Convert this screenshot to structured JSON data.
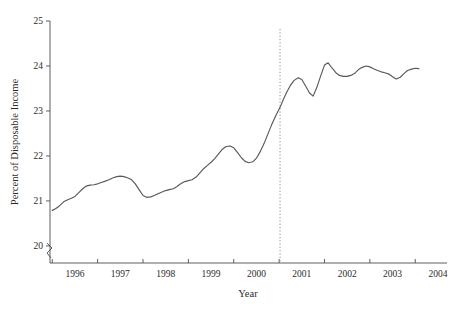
{
  "chart_data": {
    "type": "line",
    "title": "",
    "xlabel": "Year",
    "ylabel": "Percent of Disposable Income",
    "xlim": [
      1995.45,
      2004.2
    ],
    "ylim": [
      19.62,
      25.0
    ],
    "yaxis_break": true,
    "grid": false,
    "legend": false,
    "xticks": [
      1996,
      1997,
      1998,
      1999,
      2000,
      2001,
      2002,
      2003,
      2004
    ],
    "xtick_labels": [
      "1996",
      "1997",
      "1998",
      "1999",
      "2000",
      "2001",
      "2002",
      "2003",
      "2004"
    ],
    "yticks": [
      20,
      21,
      22,
      23,
      24,
      25
    ],
    "ytick_labels": [
      "20",
      "21",
      "22",
      "23",
      "24",
      "25"
    ],
    "line_color": "#595959",
    "annotations": [
      {
        "name": "vertical-reference-line",
        "type": "vline",
        "x": 2000.52,
        "style": "dotted",
        "color": "#8c8c8c"
      }
    ],
    "series": [
      {
        "name": "Percent of Disposable Income",
        "color": "#595959",
        "x": [
          1995.5,
          1995.58,
          1995.67,
          1995.75,
          1995.83,
          1995.92,
          1996.0,
          1996.08,
          1996.17,
          1996.25,
          1996.33,
          1996.42,
          1996.5,
          1996.58,
          1996.67,
          1996.75,
          1996.83,
          1996.92,
          1997.0,
          1997.08,
          1997.17,
          1997.25,
          1997.33,
          1997.42,
          1997.5,
          1997.58,
          1997.67,
          1997.75,
          1997.83,
          1997.92,
          1998.0,
          1998.08,
          1998.17,
          1998.25,
          1998.33,
          1998.42,
          1998.5,
          1998.58,
          1998.67,
          1998.75,
          1998.83,
          1998.92,
          1999.0,
          1999.08,
          1999.17,
          1999.25,
          1999.33,
          1999.42,
          1999.5,
          1999.58,
          1999.67,
          1999.75,
          1999.83,
          1999.92,
          2000.0,
          2000.08,
          2000.17,
          2000.25,
          2000.33,
          2000.42,
          2000.52,
          2000.6,
          2000.67,
          2000.75,
          2000.83,
          2000.92,
          2001.0,
          2001.08,
          2001.17,
          2001.25,
          2001.33,
          2001.42,
          2001.5,
          2001.58,
          2001.67,
          2001.75,
          2001.83,
          2001.92,
          2002.0,
          2002.08,
          2002.17,
          2002.25,
          2002.33,
          2002.42,
          2002.5,
          2002.58,
          2002.67,
          2002.75,
          2002.83,
          2002.92,
          2003.0,
          2003.08,
          2003.17,
          2003.25,
          2003.33,
          2003.42,
          2003.5,
          2003.58
        ],
        "y": [
          20.79,
          20.83,
          20.9,
          20.98,
          21.02,
          21.06,
          21.1,
          21.18,
          21.27,
          21.33,
          21.35,
          21.36,
          21.38,
          21.41,
          21.44,
          21.47,
          21.51,
          21.54,
          21.55,
          21.54,
          21.51,
          21.47,
          21.38,
          21.24,
          21.12,
          21.08,
          21.09,
          21.12,
          21.16,
          21.2,
          21.23,
          21.25,
          21.27,
          21.32,
          21.38,
          21.43,
          21.45,
          21.47,
          21.53,
          21.62,
          21.71,
          21.79,
          21.86,
          21.94,
          22.05,
          22.15,
          22.21,
          22.22,
          22.18,
          22.08,
          21.96,
          21.88,
          21.85,
          21.87,
          21.95,
          22.09,
          22.28,
          22.48,
          22.68,
          22.88,
          23.08,
          23.27,
          23.42,
          23.57,
          23.68,
          23.74,
          23.7,
          23.56,
          23.4,
          23.33,
          23.52,
          23.79,
          24.02,
          24.07,
          23.95,
          23.85,
          23.79,
          23.77,
          23.77,
          23.79,
          23.84,
          23.92,
          23.97,
          24.0,
          23.98,
          23.94,
          23.9,
          23.87,
          23.85,
          23.82,
          23.76,
          23.71,
          23.75,
          23.83,
          23.9,
          23.93,
          23.95,
          23.94
        ]
      }
    ]
  }
}
